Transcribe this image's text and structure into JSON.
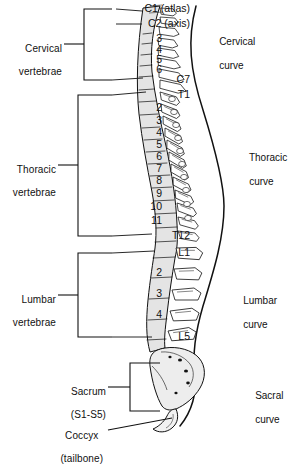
{
  "figure": {
    "ink": "#111111",
    "bone_fill": "#ffffff",
    "body_fill": "#e4e4e4",
    "sacrum_fill": "#ededed"
  },
  "regions": [
    {
      "name": "cervical",
      "label_line1": "Cervical",
      "label_line2": "vertebrae"
    },
    {
      "name": "thoracic",
      "label_line1": "Thoracic",
      "label_line2": "vertebrae"
    },
    {
      "name": "lumbar",
      "label_line1": "Lumbar",
      "label_line2": "vertebrae"
    },
    {
      "name": "sacrum",
      "label_line1": "Sacrum",
      "label_line2": "(S1-S5)"
    },
    {
      "name": "coccyx",
      "label_line1": "Coccyx",
      "label_line2": "(tailbone)"
    }
  ],
  "curves": [
    {
      "name": "cervical-curve",
      "line1": "Cervical",
      "line2": "curve"
    },
    {
      "name": "thoracic-curve",
      "line1": "Thoracic",
      "line2": "curve"
    },
    {
      "name": "lumbar-curve",
      "line1": "Lumbar",
      "line2": "curve"
    },
    {
      "name": "sacral-curve",
      "line1": "Sacral",
      "line2": "curve"
    }
  ],
  "vertebrae": [
    {
      "id": "C1",
      "text": "C1 (atlas)",
      "y": 9,
      "leader": true
    },
    {
      "id": "C2",
      "text": "C2 (axis)",
      "y": 24,
      "leader": true
    },
    {
      "id": "C3",
      "text": "3",
      "y": 39,
      "leader": false
    },
    {
      "id": "C4",
      "text": "4",
      "y": 50,
      "leader": false
    },
    {
      "id": "C5",
      "text": "5",
      "y": 60,
      "leader": false
    },
    {
      "id": "C6",
      "text": "6",
      "y": 70,
      "leader": false
    },
    {
      "id": "C7",
      "text": "C7",
      "y": 80,
      "leader": true
    },
    {
      "id": "T1",
      "text": "T1",
      "y": 95,
      "leader": true
    },
    {
      "id": "T2",
      "text": "2",
      "y": 108,
      "leader": false
    },
    {
      "id": "T3",
      "text": "3",
      "y": 121,
      "leader": false
    },
    {
      "id": "T4",
      "text": "4",
      "y": 133,
      "leader": false
    },
    {
      "id": "T5",
      "text": "5",
      "y": 145,
      "leader": false
    },
    {
      "id": "T6",
      "text": "6",
      "y": 157,
      "leader": false
    },
    {
      "id": "T7",
      "text": "7",
      "y": 169,
      "leader": false
    },
    {
      "id": "T8",
      "text": "8",
      "y": 181,
      "leader": false
    },
    {
      "id": "T9",
      "text": "9",
      "y": 194,
      "leader": false
    },
    {
      "id": "T10",
      "text": "10",
      "y": 207,
      "leader": false
    },
    {
      "id": "T11",
      "text": "11",
      "y": 221,
      "leader": false
    },
    {
      "id": "T12",
      "text": "T12",
      "y": 236,
      "leader": true
    },
    {
      "id": "L1",
      "text": "L1",
      "y": 253,
      "leader": true
    },
    {
      "id": "L2",
      "text": "2",
      "y": 273,
      "leader": false
    },
    {
      "id": "L3",
      "text": "3",
      "y": 294,
      "leader": false
    },
    {
      "id": "L4",
      "text": "4",
      "y": 315,
      "leader": false
    },
    {
      "id": "L5",
      "text": "L5",
      "y": 337,
      "leader": true
    }
  ]
}
